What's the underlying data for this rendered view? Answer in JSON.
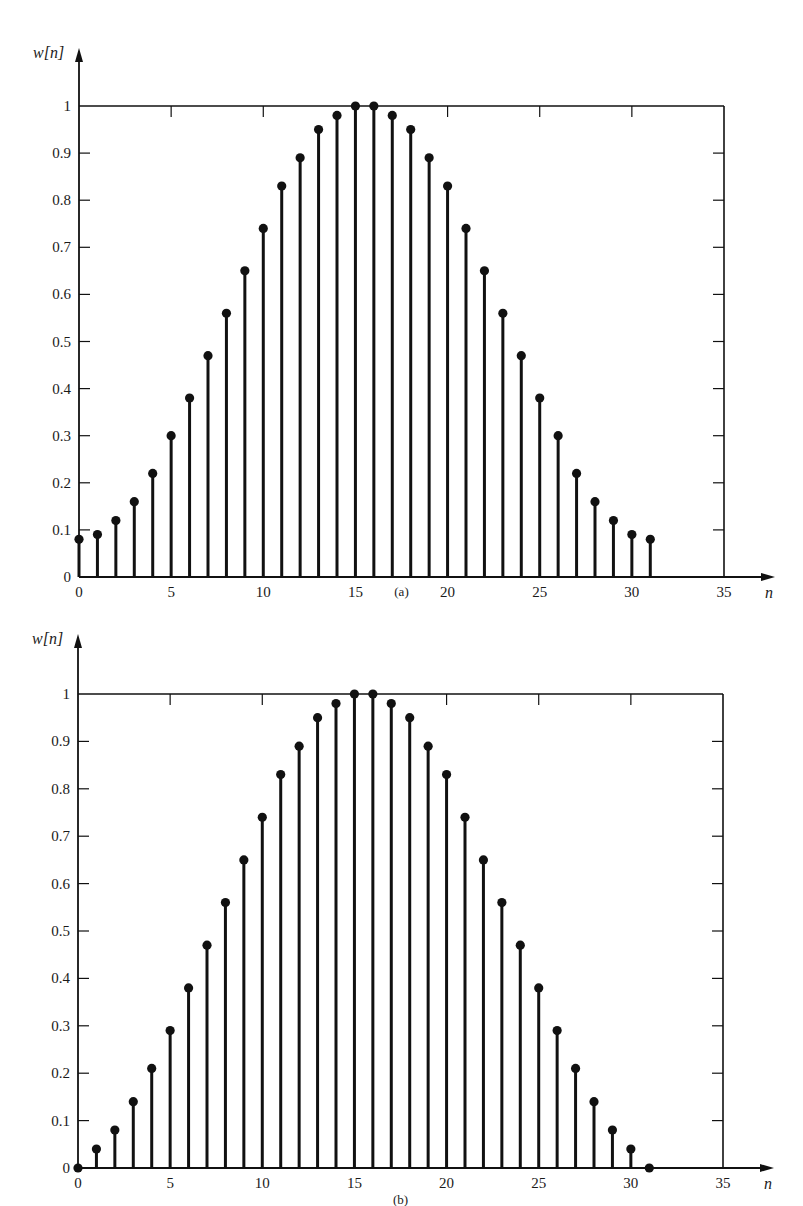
{
  "chart_data": [
    {
      "type": "stem",
      "panel_label": "(a)",
      "ylabel": "w[n]",
      "xlabel": "n",
      "x": [
        0,
        1,
        2,
        3,
        4,
        5,
        6,
        7,
        8,
        9,
        10,
        11,
        12,
        13,
        14,
        15,
        16,
        17,
        18,
        19,
        20,
        21,
        22,
        23,
        24,
        25,
        26,
        27,
        28,
        29,
        30,
        31
      ],
      "values": [
        0.08,
        0.09,
        0.12,
        0.16,
        0.22,
        0.3,
        0.38,
        0.47,
        0.56,
        0.65,
        0.74,
        0.83,
        0.89,
        0.95,
        0.98,
        1.0,
        1.0,
        0.98,
        0.95,
        0.89,
        0.83,
        0.74,
        0.65,
        0.56,
        0.47,
        0.38,
        0.3,
        0.22,
        0.16,
        0.12,
        0.09,
        0.08
      ],
      "xlim": [
        0,
        35
      ],
      "ylim": [
        0,
        1
      ],
      "xticks": [
        0,
        5,
        10,
        15,
        20,
        25,
        30,
        35
      ],
      "xtick_labels": [
        "0",
        "5",
        "10",
        "15",
        "20",
        "25",
        "30",
        "35"
      ],
      "yticks": [
        0,
        0.1,
        0.2,
        0.3,
        0.4,
        0.5,
        0.6,
        0.7,
        0.8,
        0.9,
        1
      ],
      "ytick_labels": [
        "0",
        "0.1",
        "0.2",
        "0.3",
        "0.4",
        "0.5",
        "0.6",
        "0.7",
        "0.8",
        "0.9",
        "1"
      ],
      "grid": false,
      "frame": "box"
    },
    {
      "type": "stem",
      "panel_label": "(b)",
      "ylabel": "w[n]",
      "xlabel": "n",
      "x": [
        0,
        1,
        2,
        3,
        4,
        5,
        6,
        7,
        8,
        9,
        10,
        11,
        12,
        13,
        14,
        15,
        16,
        17,
        18,
        19,
        20,
        21,
        22,
        23,
        24,
        25,
        26,
        27,
        28,
        29,
        30,
        31
      ],
      "values": [
        0.0,
        0.04,
        0.08,
        0.14,
        0.21,
        0.29,
        0.38,
        0.47,
        0.56,
        0.65,
        0.74,
        0.83,
        0.89,
        0.95,
        0.98,
        1.0,
        1.0,
        0.98,
        0.95,
        0.89,
        0.83,
        0.74,
        0.65,
        0.56,
        0.47,
        0.38,
        0.29,
        0.21,
        0.14,
        0.08,
        0.04,
        0.0
      ],
      "xlim": [
        0,
        35
      ],
      "ylim": [
        0,
        1
      ],
      "xticks": [
        0,
        5,
        10,
        15,
        20,
        25,
        30,
        35
      ],
      "xtick_labels": [
        "0",
        "5",
        "10",
        "15",
        "20",
        "25",
        "30",
        "35"
      ],
      "yticks": [
        0,
        0.1,
        0.2,
        0.3,
        0.4,
        0.5,
        0.6,
        0.7,
        0.8,
        0.9,
        1
      ],
      "ytick_labels": [
        "0",
        "0.1",
        "0.2",
        "0.3",
        "0.4",
        "0.5",
        "0.6",
        "0.7",
        "0.8",
        "0.9",
        "1"
      ],
      "grid": false,
      "frame": "box"
    }
  ],
  "colors": {
    "ink": "#111111",
    "background": "#ffffff"
  }
}
